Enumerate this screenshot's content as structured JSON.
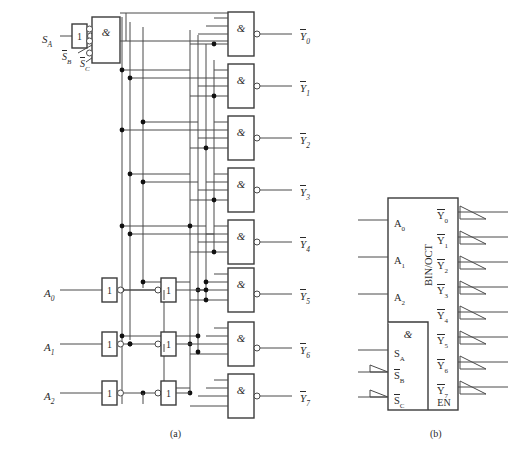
{
  "figure": {
    "caption_a": "(a)",
    "caption_b": "(b)",
    "gate_symbol": "&",
    "buffer_symbol": "1",
    "block_label": "BIN/OCT",
    "enable_label": "EN"
  },
  "diagram_a": {
    "control_inputs": [
      {
        "name": "S_A",
        "base": "S",
        "sub": "A",
        "overbar": false
      },
      {
        "name": "S_B_bar",
        "base": "S",
        "sub": "B",
        "overbar": true
      },
      {
        "name": "S_C_bar",
        "base": "S",
        "sub": "C",
        "overbar": true
      }
    ],
    "address_inputs": [
      {
        "name": "A0",
        "base": "A",
        "sub": "0"
      },
      {
        "name": "A1",
        "base": "A",
        "sub": "1"
      },
      {
        "name": "A2",
        "base": "A",
        "sub": "2"
      }
    ],
    "outputs": [
      {
        "name": "Y0_bar",
        "base": "Y",
        "sub": "0"
      },
      {
        "name": "Y1_bar",
        "base": "Y",
        "sub": "1"
      },
      {
        "name": "Y2_bar",
        "base": "Y",
        "sub": "2"
      },
      {
        "name": "Y3_bar",
        "base": "Y",
        "sub": "3"
      },
      {
        "name": "Y4_bar",
        "base": "Y",
        "sub": "4"
      },
      {
        "name": "Y5_bar",
        "base": "Y",
        "sub": "5"
      },
      {
        "name": "Y6_bar",
        "base": "Y",
        "sub": "6"
      },
      {
        "name": "Y7_bar",
        "base": "Y",
        "sub": "7"
      }
    ],
    "nand_count": 8,
    "nand_inputs_each": 4
  },
  "diagram_b": {
    "block_label": "BIN/OCT",
    "enable_label": "EN",
    "gate_symbol": "&",
    "inputs": [
      {
        "base": "A",
        "sub": "0",
        "overbar": false,
        "triangle": false
      },
      {
        "base": "A",
        "sub": "1",
        "overbar": false,
        "triangle": false
      },
      {
        "base": "A",
        "sub": "2",
        "overbar": false,
        "triangle": false
      },
      {
        "base": "S",
        "sub": "A",
        "overbar": false,
        "triangle": false
      },
      {
        "base": "S",
        "sub": "B",
        "overbar": true,
        "triangle": true
      },
      {
        "base": "S",
        "sub": "C",
        "overbar": true,
        "triangle": true
      }
    ],
    "outputs": [
      {
        "base": "Y",
        "sub": "0",
        "overbar": true
      },
      {
        "base": "Y",
        "sub": "1",
        "overbar": true
      },
      {
        "base": "Y",
        "sub": "2",
        "overbar": true
      },
      {
        "base": "Y",
        "sub": "3",
        "overbar": true
      },
      {
        "base": "Y",
        "sub": "4",
        "overbar": true
      },
      {
        "base": "Y",
        "sub": "5",
        "overbar": true
      },
      {
        "base": "Y",
        "sub": "6",
        "overbar": true
      },
      {
        "base": "Y",
        "sub": "7",
        "overbar": true
      }
    ]
  },
  "colors": {
    "wire": "#4a4a4a",
    "box_stroke": "#3b3b3b",
    "text": "#2b2b2b",
    "background": "#ffffff"
  }
}
